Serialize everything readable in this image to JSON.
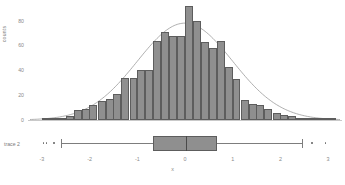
{
  "chart_data": {
    "type": "bar",
    "title": "",
    "xlabel": "x",
    "ylabel": "counts",
    "xlim": [
      -3.25,
      3.25
    ],
    "ylim": [
      0,
      95
    ],
    "grid": false,
    "legend_position": "none",
    "xticks": [
      "-3",
      "-2",
      "-1",
      "0",
      "1",
      "2",
      "3"
    ],
    "xtick_values": [
      -3,
      -2,
      -1,
      0,
      1,
      2,
      3
    ],
    "yticks": [
      "0",
      "20",
      "40",
      "60",
      "80"
    ],
    "ytick_values": [
      0,
      20,
      40,
      60,
      80
    ],
    "bin_width": 0.1667,
    "bin_centers": [
      -2.92,
      -2.75,
      -2.58,
      -2.42,
      -2.25,
      -2.08,
      -1.92,
      -1.75,
      -1.58,
      -1.42,
      -1.25,
      -1.08,
      -0.92,
      -0.75,
      -0.58,
      -0.42,
      -0.25,
      -0.08,
      0.08,
      0.25,
      0.42,
      0.58,
      0.75,
      0.92,
      1.08,
      1.25,
      1.42,
      1.58,
      1.75,
      1.92,
      2.08,
      2.25,
      2.42,
      2.58,
      2.75,
      2.92,
      3.08
    ],
    "values": [
      2,
      2,
      2,
      3,
      8,
      9,
      12,
      15,
      17,
      21,
      34,
      34,
      40,
      40,
      64,
      71,
      68,
      68,
      92,
      80,
      63,
      58,
      64,
      43,
      33,
      16,
      13,
      12,
      9,
      6,
      4,
      3,
      2,
      1,
      1,
      1,
      1
    ],
    "series": [
      {
        "name": "histogram",
        "type": "bar",
        "values": [
          2,
          2,
          2,
          3,
          8,
          9,
          12,
          15,
          17,
          21,
          34,
          34,
          40,
          40,
          64,
          71,
          68,
          68,
          92,
          80,
          63,
          58,
          64,
          43,
          33,
          16,
          13,
          12,
          9,
          6,
          4,
          3,
          2,
          1,
          1,
          1,
          1
        ]
      },
      {
        "name": "normal-fit-curve",
        "type": "line",
        "peak_value": 78,
        "mean": 0.0,
        "stddev": 1.0
      }
    ],
    "boxplot": {
      "label": "trace 2",
      "q1": -0.67,
      "median": 0.02,
      "q3": 0.67,
      "whisker_low": -2.6,
      "whisker_high": 2.45,
      "outliers_low": [
        -2.97,
        -2.9,
        -2.75
      ],
      "outliers_high": [
        2.66,
        2.95
      ]
    }
  },
  "axes": {
    "y_title": "counts",
    "x_title": "x"
  },
  "caption": ""
}
